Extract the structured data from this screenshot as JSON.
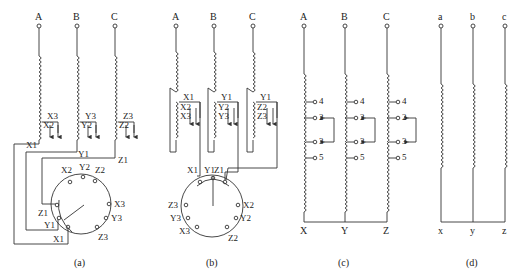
{
  "figure": {
    "panels": [
      {
        "id": "a",
        "caption": "(a)",
        "terminals": [
          "A",
          "B",
          "C"
        ],
        "tap_labels": {
          "upper": [
            "X3",
            "Y3",
            "Z3"
          ],
          "lower": [
            "X2",
            "Y2",
            "Z2"
          ]
        },
        "lead_labels": [
          "X1",
          "Y1",
          "Z1"
        ],
        "switch_labels": {
          "top": [
            "X2",
            "Y2",
            "Z2"
          ],
          "right": [
            "X3",
            "Y3"
          ],
          "bottom_right": "Z3",
          "left": [
            "Z1",
            "Y1",
            "X1"
          ]
        }
      },
      {
        "id": "b",
        "caption": "(b)",
        "terminals": [
          "A",
          "B",
          "C"
        ],
        "tap_header_labels": [
          "X1",
          "Y1",
          "Y1"
        ],
        "tap_labels": {
          "upper": [
            "X2",
            "Y2",
            "Z2"
          ],
          "lower": [
            "X3",
            "Y3",
            "Z3"
          ]
        },
        "switch_labels": {
          "top": [
            "X1",
            "Y1",
            "Z1"
          ],
          "left": [
            "Z3",
            "Y3",
            "X3"
          ],
          "right": [
            "X2",
            "Y2"
          ],
          "bottom_right": "Z2"
        }
      },
      {
        "id": "c",
        "caption": "(c)",
        "terminals": [
          "A",
          "B",
          "C"
        ],
        "tap_numbers": [
          "4",
          "2",
          "3",
          "5"
        ],
        "neutral_labels": [
          "X",
          "Y",
          "Z"
        ]
      },
      {
        "id": "d",
        "caption": "(d)",
        "terminals": [
          "a",
          "b",
          "c"
        ],
        "neutral_labels": [
          "x",
          "y",
          "z"
        ],
        "side_numbers": [
          "4",
          "2",
          "3",
          "5"
        ]
      }
    ]
  }
}
